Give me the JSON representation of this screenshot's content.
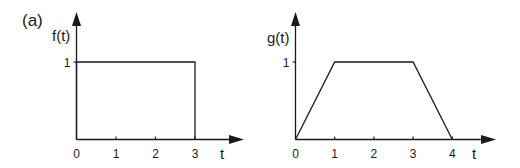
{
  "figure": {
    "panel_label": "(a)"
  },
  "chart_data": [
    {
      "type": "line",
      "title": "",
      "ylabel": "f(t)",
      "xlabel": "t",
      "x_ticks": [
        "0",
        "1",
        "2",
        "3"
      ],
      "y_ticks": [
        "1"
      ],
      "xlim": [
        0,
        3.9
      ],
      "ylim": [
        0,
        1.7
      ],
      "grid": false,
      "series": [
        {
          "name": "f(t)",
          "points": [
            [
              0,
              0
            ],
            [
              0,
              1
            ],
            [
              3,
              1
            ],
            [
              3,
              0
            ]
          ]
        }
      ]
    },
    {
      "type": "line",
      "title": "",
      "ylabel": "g(t)",
      "xlabel": "t",
      "x_ticks": [
        "0",
        "1",
        "2",
        "3",
        "4"
      ],
      "y_ticks": [
        "1"
      ],
      "xlim": [
        0,
        5.1
      ],
      "ylim": [
        0,
        1.7
      ],
      "grid": false,
      "series": [
        {
          "name": "g(t)",
          "points": [
            [
              0,
              0
            ],
            [
              1,
              1
            ],
            [
              3,
              1
            ],
            [
              4,
              0
            ]
          ]
        }
      ]
    }
  ]
}
